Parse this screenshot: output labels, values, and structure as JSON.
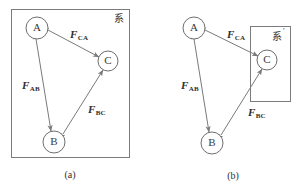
{
  "figure": {
    "width": 301,
    "height": 194,
    "background": "#ffffff",
    "line_color": "#7a7a7a",
    "text_color": "#2e2e2e"
  },
  "panels": [
    {
      "id": "panel-a",
      "caption": "(a)",
      "caption_pos": {
        "x": 70,
        "y": 176
      },
      "frame": {
        "x": 11,
        "y": 9,
        "width": 119,
        "height": 149,
        "label": "系",
        "label_pos": {
          "x": 119,
          "y": 19
        }
      },
      "nodes": [
        {
          "id": "A",
          "label": "A",
          "cx": 37,
          "cy": 28,
          "r": 11
        },
        {
          "id": "B",
          "label": "B",
          "cx": 54,
          "cy": 142,
          "r": 11
        },
        {
          "id": "C",
          "label": "C",
          "cx": 108,
          "cy": 61,
          "r": 10
        }
      ],
      "forces": [
        {
          "id": "F-CA",
          "symbol": "F",
          "subscript": "CA",
          "label_pos": {
            "x": 70,
            "y": 38
          },
          "from": {
            "x": 48,
            "y": 30
          },
          "to": {
            "x": 99,
            "y": 57
          },
          "arrow_start": true,
          "arrow_end": true
        },
        {
          "id": "F-AB",
          "symbol": "F",
          "subscript": "AB",
          "label_pos": {
            "x": 22,
            "y": 89
          },
          "from": {
            "x": 36,
            "y": 39
          },
          "to": {
            "x": 51,
            "y": 131
          },
          "arrow_start": true,
          "arrow_end": true
        },
        {
          "id": "F-BC",
          "symbol": "F",
          "subscript": "BC",
          "label_pos": {
            "x": 88,
            "y": 113
          },
          "from": {
            "x": 63,
            "y": 134
          },
          "to": {
            "x": 103,
            "y": 70
          },
          "arrow_start": true,
          "arrow_end": true
        }
      ]
    },
    {
      "id": "panel-b",
      "caption": "(b)",
      "caption_pos": {
        "x": 233,
        "y": 177
      },
      "frame": {
        "x": 250,
        "y": 26,
        "width": 41,
        "height": 76,
        "label": "系",
        "prime": "′",
        "label_pos": {
          "x": 278,
          "y": 37
        }
      },
      "nodes": [
        {
          "id": "A",
          "label": "A",
          "cx": 194,
          "cy": 28,
          "r": 11
        },
        {
          "id": "B",
          "label": "B",
          "cx": 212,
          "cy": 143,
          "r": 11
        },
        {
          "id": "C",
          "label": "C",
          "cx": 267,
          "cy": 60,
          "r": 10
        }
      ],
      "forces": [
        {
          "id": "F-CA",
          "symbol": "F",
          "subscript": "CA",
          "label_pos": {
            "x": 227,
            "y": 38
          },
          "from": {
            "x": 205,
            "y": 30
          },
          "to": {
            "x": 258,
            "y": 56
          },
          "arrow_start": true,
          "arrow_end": true
        },
        {
          "id": "F-AB",
          "symbol": "F",
          "subscript": "AB",
          "label_pos": {
            "x": 181,
            "y": 89
          },
          "from": {
            "x": 194,
            "y": 39
          },
          "to": {
            "x": 209,
            "y": 132
          },
          "arrow_start": true,
          "arrow_end": true
        },
        {
          "id": "F-BC",
          "symbol": "F",
          "subscript": "BC",
          "label_pos": {
            "x": 248,
            "y": 116
          },
          "from": {
            "x": 221,
            "y": 135
          },
          "to": {
            "x": 262,
            "y": 69
          },
          "arrow_start": true,
          "arrow_end": true
        }
      ]
    }
  ]
}
